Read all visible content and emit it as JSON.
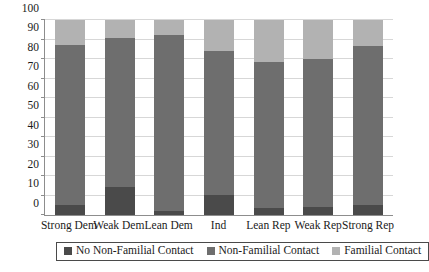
{
  "chart_data": {
    "type": "bar",
    "subtype": "stacked-100-percent",
    "title": "",
    "xlabel": "",
    "ylabel": "",
    "ylim": [
      0,
      100
    ],
    "ytick_step": 10,
    "yticks": [
      0,
      10,
      20,
      30,
      40,
      50,
      60,
      70,
      80,
      90,
      100
    ],
    "ytick_labels": [
      "0",
      "10",
      "20",
      "30",
      "40",
      "50",
      "60",
      "70",
      "80",
      "90",
      "100"
    ],
    "grid": true,
    "grid_axis": "y",
    "legend_position": "bottom",
    "categories": [
      "Strong Dem",
      "Weak Dem",
      "Lean Dem",
      "Ind",
      "Lean Rep",
      "Weak Rep",
      "Strong Rep"
    ],
    "series": [
      {
        "name": "No Non-Familial Contact",
        "color": "#4a4a4a",
        "values": [
          5,
          14.5,
          2,
          10.5,
          3.5,
          4,
          5
        ]
      },
      {
        "name": "Non-Familial Contact",
        "color": "#6e6e6e",
        "values": [
          82,
          76.5,
          90.5,
          73.5,
          75,
          76,
          81.5
        ]
      },
      {
        "name": "Familial Contact",
        "color": "#b2b2b2",
        "values": [
          13,
          9,
          7.5,
          16,
          21.5,
          20,
          13.5
        ]
      }
    ],
    "cumulative_boundaries": [
      [
        5,
        87
      ],
      [
        14.5,
        91
      ],
      [
        2,
        92.5
      ],
      [
        10.5,
        84
      ],
      [
        3.5,
        78.5
      ],
      [
        4,
        80
      ],
      [
        5,
        86.5
      ]
    ]
  },
  "legend": {
    "items": [
      {
        "label": "No Non-Familial Contact",
        "color": "#4a4a4a"
      },
      {
        "label": "Non-Familial Contact",
        "color": "#6e6e6e"
      },
      {
        "label": "Familial Contact",
        "color": "#b2b2b2"
      }
    ]
  },
  "axis_colors": {
    "axis_line": "#8d8d8d",
    "gridline": "#d7d7d7",
    "text": "#1a1a1a",
    "background": "#ffffff"
  }
}
